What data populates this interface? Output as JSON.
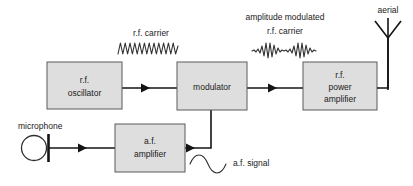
{
  "diagram": {
    "background_color": "#ffffff",
    "block_fill_color": "#dedede",
    "block_border_color": "#5a5a5a",
    "wire_color": "#141414",
    "blocks": [
      {
        "name": "rf-oscillator",
        "lines": [
          "r.f.",
          "oscillator"
        ],
        "line1": "r.f.",
        "line2": "oscillator",
        "line3": ""
      },
      {
        "name": "modulator",
        "lines": [
          "modulator"
        ],
        "line1": "modulator",
        "line2": "",
        "line3": ""
      },
      {
        "name": "rf-power-amplifier",
        "lines": [
          "r.f.",
          "power",
          "amplifier"
        ],
        "line1": "r.f.",
        "line2": "power",
        "line3": "amplifier"
      },
      {
        "name": "af-amplifier",
        "lines": [
          "a.f.",
          "amplifier"
        ],
        "line1": "a.f.",
        "line2": "amplifier",
        "line3": ""
      }
    ],
    "annotations": {
      "rf_carrier": "r.f. carrier",
      "am_carrier_line1": "amplitude modulated",
      "am_carrier_line2": "r.f. carrier",
      "aerial": "aerial",
      "microphone": "microphone",
      "af_signal": "a.f. signal"
    },
    "waveforms": {
      "rf_carrier": {
        "type": "sine",
        "cycles": 9,
        "amplitude": 11,
        "description": "high frequency constant amplitude carrier"
      },
      "am_carrier": {
        "type": "amplitude-modulated",
        "cycles": 18,
        "envelope_peaks": 2,
        "amplitude": 9,
        "description": "amplitude modulated r.f. carrier"
      },
      "af_signal": {
        "type": "sine",
        "cycles": 1.5,
        "amplitude": 6,
        "description": "low frequency audio signal"
      }
    },
    "symbols": {
      "microphone": "circle-with-bar",
      "aerial": "vertical-mast-with-v-top"
    }
  }
}
